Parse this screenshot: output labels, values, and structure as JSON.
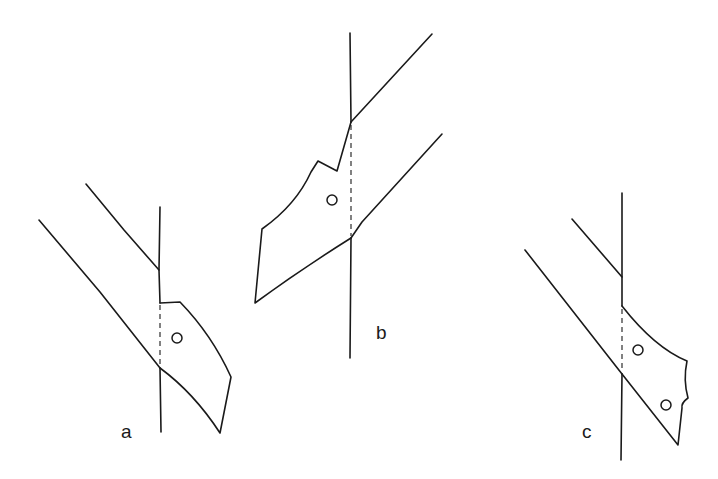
{
  "figure": {
    "stroke_color": "#1a1a1a",
    "background": "#ffffff",
    "panels": [
      {
        "id": "a",
        "label": "a",
        "holes": 1
      },
      {
        "id": "b",
        "label": "b",
        "holes": 1
      },
      {
        "id": "c",
        "label": "c",
        "holes": 2
      }
    ]
  }
}
